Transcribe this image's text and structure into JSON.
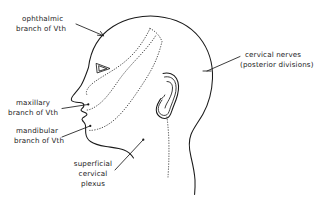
{
  "figure": {
    "name": "head-dermatome-diagram",
    "background_color": "#ffffff",
    "line_color": "#1a1a1a",
    "dotted_boundary_color": "#3a3a3a",
    "width": 322,
    "height": 197
  },
  "labels": {
    "ophthalmic": {
      "lines": [
        "ophthalmic",
        "branch of Vth"
      ],
      "line1": "ophthalmic",
      "line2": "branch of Vth",
      "align": "left"
    },
    "maxillary": {
      "lines": [
        "maxillary",
        "branch of Vth"
      ],
      "line1": "maxillary",
      "line2": "branch of Vth",
      "align": "left"
    },
    "mandibular": {
      "lines": [
        "mandibular",
        "branch of Vth"
      ],
      "line1": "mandibular",
      "line2": "branch of Vth",
      "align": "left"
    },
    "superficial_cervical_plexus": {
      "lines": [
        "superficial",
        "cervical",
        "plexus"
      ],
      "line1": "superficial",
      "line2": "cervical",
      "line3": "plexus",
      "align": "center"
    },
    "cervical_nerves": {
      "lines": [
        "cervical  nerves",
        "(posterior divisions)"
      ],
      "line1": "cervical  nerves",
      "line2": "(posterior divisions)",
      "align": "left"
    }
  }
}
